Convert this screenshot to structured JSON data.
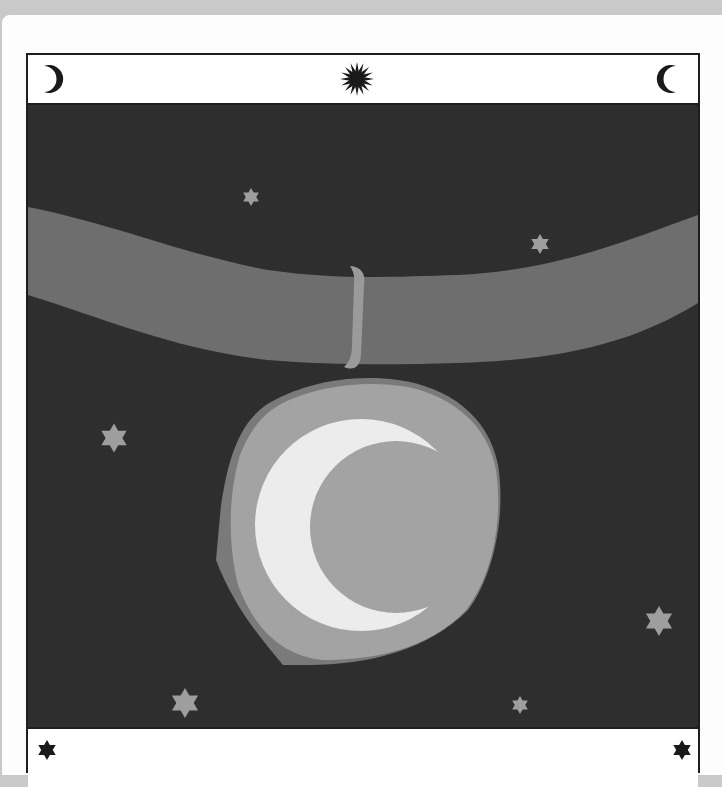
{
  "card": {
    "header": {
      "icons": [
        "waxing-crescent-icon",
        "sun-burst-icon",
        "waning-crescent-icon"
      ]
    },
    "scene": {
      "description": "Pendant with crescent moon hanging from a ribbon against a starry night sky",
      "colors": {
        "sky": "#2e2e2e",
        "ribbon": "#6e6e6e",
        "loop": "#9a9a9a",
        "pendant_outer": "#7a7a7a",
        "pendant_rim": "#a3a3a3",
        "crescent": "#ececec",
        "moon_face": "#a3a3a3",
        "star": "#9e9e9e"
      },
      "stars": [
        {
          "x": 223,
          "y": 92,
          "r": 9
        },
        {
          "x": 512,
          "y": 139,
          "r": 10
        },
        {
          "x": 86,
          "y": 333,
          "r": 14
        },
        {
          "x": 631,
          "y": 516,
          "r": 15
        },
        {
          "x": 157,
          "y": 598,
          "r": 15
        },
        {
          "x": 492,
          "y": 600,
          "r": 9
        }
      ]
    },
    "footer": {
      "icons": [
        "six-point-star-icon",
        "six-point-star-icon"
      ]
    }
  }
}
